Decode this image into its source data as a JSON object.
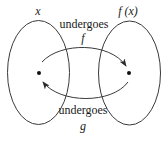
{
  "diagram": {
    "type": "mapping-diagram",
    "colors": {
      "stroke": "#3a3a3a",
      "text": "#1a1a1a",
      "background": "#ffffff"
    },
    "sets": [
      {
        "label": "x",
        "ellipse": {
          "cx": 38.5,
          "cy": 72.5,
          "rx": 31,
          "ry": 52
        },
        "point": {
          "x": 39,
          "y": 73
        }
      },
      {
        "label": "f (x)",
        "ellipse": {
          "cx": 129.5,
          "cy": 73,
          "rx": 31,
          "ry": 52
        },
        "point": {
          "x": 129,
          "y": 73
        }
      }
    ],
    "arrows": [
      {
        "from": "x",
        "to": "f (x)",
        "caption": "undergoes",
        "function": "f"
      },
      {
        "from": "f (x)",
        "to": "x",
        "caption": "undergoes",
        "function": "g"
      }
    ]
  }
}
